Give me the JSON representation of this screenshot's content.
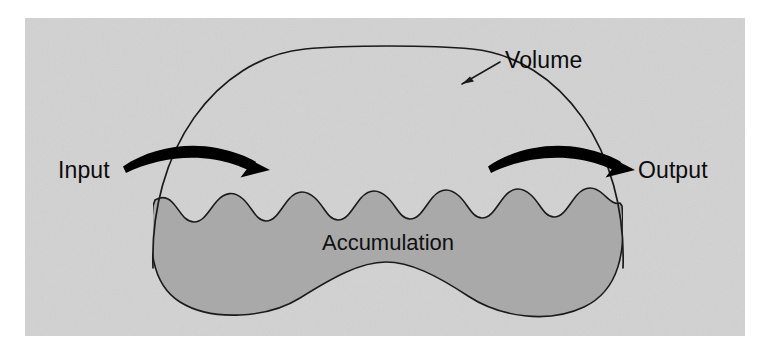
{
  "figure": {
    "type": "conceptual-diagram",
    "panel": {
      "background_color": "#d2d2d2",
      "outer_margin_color": "#ffffff",
      "x": 25,
      "y": 18,
      "width": 720,
      "height": 318
    },
    "colors": {
      "panel_background": "#d2d2d2",
      "accumulation_fill": "#a9a9a9",
      "outline_stroke": "#1a1a1a",
      "arrow_fill": "#000000",
      "text": "#0c0c0c"
    }
  },
  "labels": {
    "volume": "Volume",
    "input": "Input",
    "output": "Output",
    "accumulation": "Accumulation"
  },
  "elements": {
    "volume_boundary": {
      "name": "Volume",
      "shape": "dome",
      "filled": false,
      "stroke_width": 1.6
    },
    "accumulation_region": {
      "name": "Accumulation",
      "shape": "wavy-top-blob",
      "filled": true,
      "wave_cycles": 5.5,
      "stroke_width": 1.6
    },
    "input_arrow": {
      "name": "Input",
      "direction": "right",
      "style": "thick-tapered-curved",
      "crosses_boundary": true
    },
    "output_arrow": {
      "name": "Output",
      "direction": "right",
      "style": "thick-tapered-curved",
      "crosses_boundary": true
    },
    "volume_leader_line": {
      "name": "volume-callout",
      "style": "thin-line-with-arrowhead",
      "points_to": "volume boundary"
    }
  }
}
